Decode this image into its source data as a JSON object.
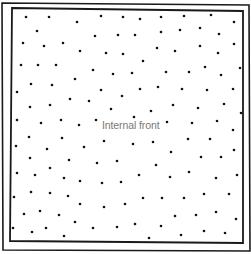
{
  "diagram": {
    "label": "Internal front",
    "label_position": {
      "x": 102,
      "y": 119
    },
    "colors": {
      "border": "#1a1a1a",
      "dot": "#111111",
      "label": "#7a7a7a",
      "background": "#ffffff"
    },
    "outer_border": {
      "points": "2,3 249,5 250,251 3,250"
    },
    "inner_border": {
      "points": "12,8 243,11 243,243 10,241"
    },
    "dot_radius": 1.3,
    "dots": [
      [
        26,
        17
      ],
      [
        49,
        17
      ],
      [
        77,
        22
      ],
      [
        101,
        16
      ],
      [
        123,
        17
      ],
      [
        140,
        19
      ],
      [
        161,
        17
      ],
      [
        184,
        16
      ],
      [
        211,
        15
      ],
      [
        234,
        22
      ],
      [
        37,
        31
      ],
      [
        95,
        36
      ],
      [
        118,
        35
      ],
      [
        135,
        35
      ],
      [
        161,
        32
      ],
      [
        180,
        30
      ],
      [
        200,
        28
      ],
      [
        219,
        34
      ],
      [
        23,
        43
      ],
      [
        44,
        46
      ],
      [
        63,
        43
      ],
      [
        80,
        51
      ],
      [
        106,
        53
      ],
      [
        123,
        54
      ],
      [
        157,
        48
      ],
      [
        175,
        51
      ],
      [
        200,
        46
      ],
      [
        218,
        53
      ],
      [
        234,
        44
      ],
      [
        143,
        61
      ],
      [
        21,
        65
      ],
      [
        38,
        65
      ],
      [
        56,
        65
      ],
      [
        93,
        70
      ],
      [
        113,
        74
      ],
      [
        132,
        73
      ],
      [
        166,
        72
      ],
      [
        189,
        72
      ],
      [
        205,
        67
      ],
      [
        221,
        75
      ],
      [
        240,
        68
      ],
      [
        75,
        79
      ],
      [
        31,
        84
      ],
      [
        52,
        85
      ],
      [
        17,
        92
      ],
      [
        101,
        90
      ],
      [
        140,
        89
      ],
      [
        158,
        87
      ],
      [
        182,
        89
      ],
      [
        207,
        90
      ],
      [
        233,
        89
      ],
      [
        122,
        96
      ],
      [
        70,
        99
      ],
      [
        89,
        101
      ],
      [
        30,
        107
      ],
      [
        50,
        105
      ],
      [
        111,
        109
      ],
      [
        151,
        111
      ],
      [
        173,
        105
      ],
      [
        198,
        108
      ],
      [
        224,
        104
      ],
      [
        134,
        117
      ],
      [
        241,
        113
      ],
      [
        17,
        120
      ],
      [
        41,
        123
      ],
      [
        61,
        120
      ],
      [
        79,
        125
      ],
      [
        96,
        120
      ],
      [
        167,
        122
      ],
      [
        192,
        123
      ],
      [
        217,
        121
      ],
      [
        233,
        130
      ],
      [
        29,
        137
      ],
      [
        62,
        138
      ],
      [
        16,
        146
      ],
      [
        47,
        149
      ],
      [
        84,
        147
      ],
      [
        104,
        141
      ],
      [
        133,
        144
      ],
      [
        153,
        142
      ],
      [
        188,
        139
      ],
      [
        210,
        139
      ],
      [
        171,
        152
      ],
      [
        234,
        150
      ],
      [
        30,
        158
      ],
      [
        69,
        160
      ],
      [
        97,
        163
      ],
      [
        117,
        161
      ],
      [
        201,
        157
      ],
      [
        221,
        157
      ],
      [
        156,
        165
      ],
      [
        50,
        168
      ],
      [
        17,
        173
      ],
      [
        35,
        175
      ],
      [
        139,
        175
      ],
      [
        170,
        177
      ],
      [
        189,
        172
      ],
      [
        237,
        175
      ],
      [
        64,
        178
      ],
      [
        80,
        181
      ],
      [
        102,
        183
      ],
      [
        121,
        182
      ],
      [
        216,
        178
      ],
      [
        14,
        197
      ],
      [
        31,
        192
      ],
      [
        50,
        193
      ],
      [
        68,
        196
      ],
      [
        143,
        198
      ],
      [
        162,
        198
      ],
      [
        184,
        198
      ],
      [
        204,
        194
      ],
      [
        229,
        194
      ],
      [
        80,
        204
      ],
      [
        104,
        207
      ],
      [
        125,
        204
      ],
      [
        24,
        214
      ],
      [
        40,
        211
      ],
      [
        59,
        215
      ],
      [
        175,
        216
      ],
      [
        196,
        215
      ],
      [
        216,
        212
      ],
      [
        75,
        222
      ],
      [
        236,
        219
      ],
      [
        135,
        224
      ],
      [
        161,
        226
      ],
      [
        13,
        228
      ],
      [
        32,
        232
      ],
      [
        46,
        228
      ],
      [
        93,
        228
      ],
      [
        117,
        227
      ],
      [
        64,
        236
      ],
      [
        149,
        238
      ],
      [
        181,
        235
      ],
      [
        204,
        231
      ],
      [
        225,
        233
      ]
    ]
  }
}
